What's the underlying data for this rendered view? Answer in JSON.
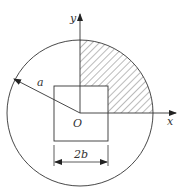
{
  "diagram": {
    "labels": {
      "y_axis": "y",
      "x_axis": "x",
      "origin": "O",
      "radius": "a",
      "square_width": "2b"
    },
    "shapes": {
      "circle": {
        "cx": 80,
        "cy": 113,
        "r": 73
      },
      "square": {
        "x": 54,
        "y": 86,
        "w": 54,
        "h": 55
      },
      "hatched_region": "first-quadrant quarter disk minus square"
    },
    "colors": {
      "stroke": "#333333",
      "hatch": "#555555",
      "background": "#ffffff"
    }
  }
}
